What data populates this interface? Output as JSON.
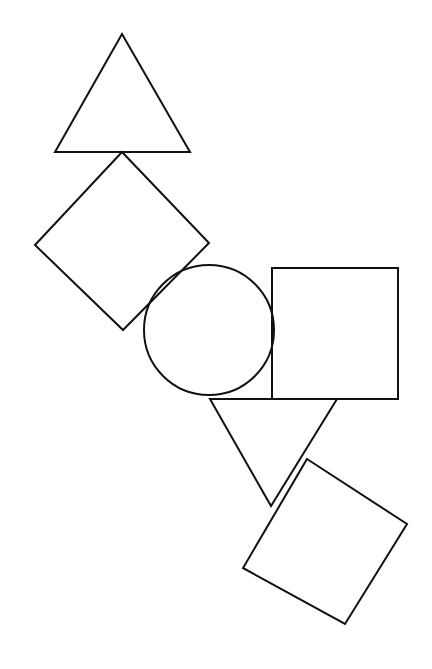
{
  "figure": {
    "width": 432,
    "height": 669,
    "background_color": "#ffffff",
    "stroke_color": "#111111",
    "stroke_width": 2,
    "fill": "none",
    "shape_count": 6
  },
  "shapes": [
    {
      "id": "triangle-up-top",
      "kind": "triangle",
      "label": "Upward triangle (top)",
      "orientation": "point-up",
      "points": "122,34 190,152 55,152",
      "vertices": [
        [
          122,
          34
        ],
        [
          190,
          152
        ],
        [
          55,
          152
        ]
      ],
      "bounds": {
        "x": 55,
        "y": 34,
        "width": 135,
        "height": 118
      }
    },
    {
      "id": "square-diamond-upper-left",
      "kind": "square",
      "label": "Rotated square / diamond (upper left)",
      "orientation": "rotated-45",
      "points": "122,152 209,243 123,330 35,245",
      "vertices": [
        [
          122,
          152
        ],
        [
          209,
          243
        ],
        [
          123,
          330
        ],
        [
          35,
          245
        ]
      ],
      "bounds": {
        "x": 35,
        "y": 152,
        "width": 174,
        "height": 178
      }
    },
    {
      "id": "circle-center",
      "kind": "circle",
      "label": "Circle (center)",
      "center": [
        209,
        330
      ],
      "radius": 65,
      "bounds": {
        "x": 144,
        "y": 265,
        "width": 130,
        "height": 130
      }
    },
    {
      "id": "square-axis-right",
      "kind": "square",
      "label": "Axis-aligned square (right)",
      "orientation": "upright",
      "points": "272,268 398,268 398,399 272,399",
      "vertices": [
        [
          272,
          268
        ],
        [
          398,
          268
        ],
        [
          398,
          399
        ],
        [
          272,
          399
        ]
      ],
      "bounds": {
        "x": 272,
        "y": 268,
        "width": 126,
        "height": 131
      }
    },
    {
      "id": "triangle-down-lower",
      "kind": "triangle",
      "label": "Downward triangle (lower middle)",
      "orientation": "point-down",
      "points": "210,399 337,399 271,506",
      "vertices": [
        [
          210,
          399
        ],
        [
          337,
          399
        ],
        [
          271,
          506
        ]
      ],
      "bounds": {
        "x": 210,
        "y": 399,
        "width": 127,
        "height": 107
      }
    },
    {
      "id": "square-tilted-bottom-right",
      "kind": "square",
      "label": "Tilted square (bottom right)",
      "orientation": "rotated-33",
      "points": "307,459 407,524 345,624 243,568",
      "vertices": [
        [
          307,
          459
        ],
        [
          407,
          524
        ],
        [
          345,
          624
        ],
        [
          243,
          568
        ]
      ],
      "bounds": {
        "x": 243,
        "y": 459,
        "width": 164,
        "height": 165
      }
    }
  ]
}
